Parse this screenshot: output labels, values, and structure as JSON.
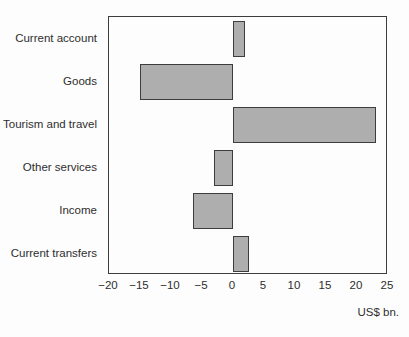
{
  "chart_data": {
    "type": "bar",
    "orientation": "horizontal",
    "title": "",
    "xlabel": "US$ bn.",
    "ylabel": "",
    "categories": [
      "Current account",
      "Goods",
      "Tourism and travel",
      "Other services",
      "Income",
      "Current transfers"
    ],
    "values": [
      2,
      -15,
      23,
      -3,
      -6.5,
      2.5
    ],
    "xlim": [
      -20,
      25
    ],
    "xticks": [
      -20,
      -15,
      -10,
      -5,
      0,
      5,
      10,
      15,
      20,
      25
    ],
    "xtick_labels": [
      "−20",
      "−15",
      "−10",
      "−5",
      "0",
      "5",
      "10",
      "15",
      "20",
      "25"
    ],
    "grid": false,
    "legend": "none",
    "colors": {
      "bar_fill": "#aeaeae",
      "bar_border": "#3d3d3d",
      "axis_border": "#3d3d3d",
      "text": "#2e2e2e",
      "background": "#fdfdfd"
    }
  }
}
